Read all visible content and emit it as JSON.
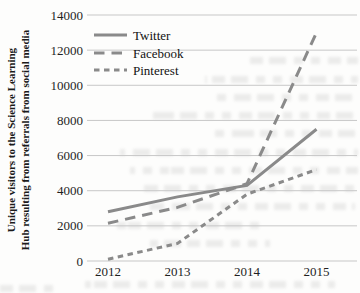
{
  "figure": {
    "ylabel_line1": "Unique visitors to the Science Learning",
    "ylabel_line2": "Hub resulting from referrals from social media"
  },
  "chart_data": {
    "type": "line",
    "title": "",
    "xlabel": "",
    "ylabel": "Unique visitors to the Science Learning Hub resulting from referrals from social media",
    "categories": [
      "2012",
      "2013",
      "2014",
      "2015"
    ],
    "series": [
      {
        "name": "Twitter",
        "dash": "solid",
        "values": [
          2800,
          3650,
          4300,
          7500
        ]
      },
      {
        "name": "Facebook",
        "dash": "long-dash",
        "values": [
          2150,
          3050,
          4400,
          13000
        ]
      },
      {
        "name": "Pinterest",
        "dash": "short-dash",
        "values": [
          100,
          1000,
          3800,
          5200
        ]
      }
    ],
    "ylim": [
      0,
      14000
    ],
    "yticks": [
      0,
      2000,
      4000,
      6000,
      8000,
      10000,
      12000,
      14000
    ],
    "grid": true,
    "legend_position": "top-left-inside",
    "line_color": "#8a8a8a",
    "gridline_color": "#c7c7c7",
    "text_color": "#1f1f1f"
  }
}
